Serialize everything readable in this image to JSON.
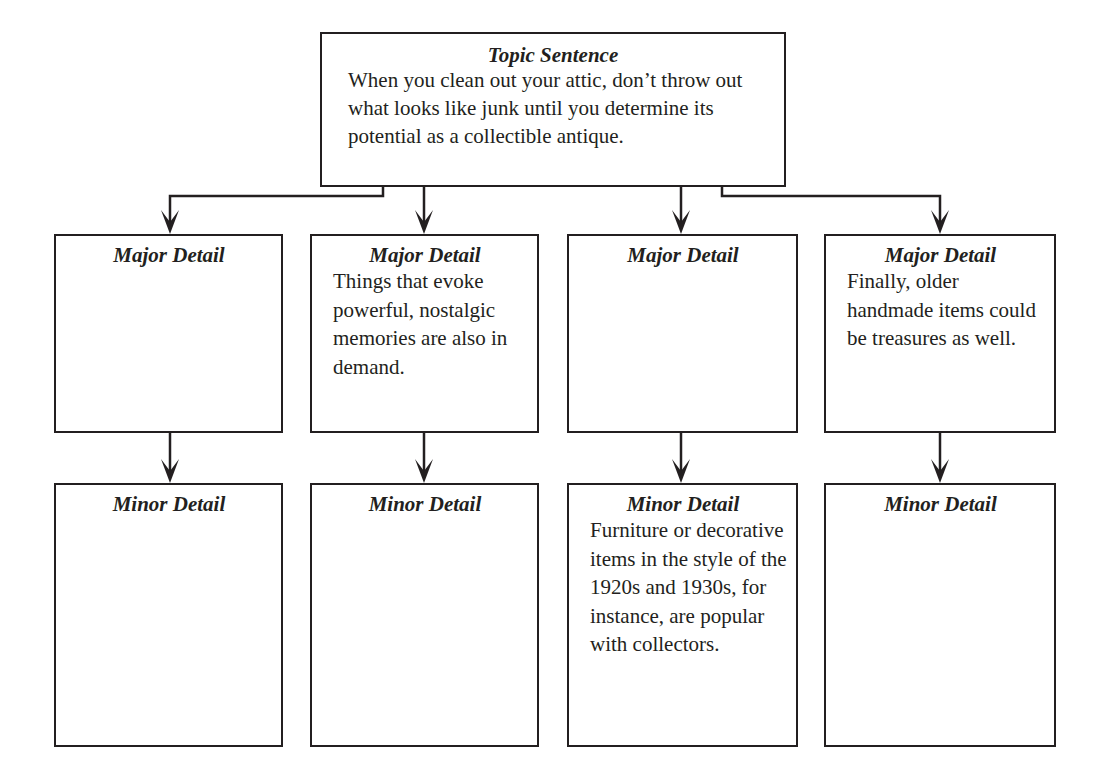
{
  "topic": {
    "title": "Topic Sentence",
    "text": "When you clean out your attic, don’t throw out what looks like junk until you determine its potential as a collectible antique."
  },
  "major_details": [
    {
      "title": "Major Detail",
      "text": ""
    },
    {
      "title": "Major Detail",
      "text": "Things that evoke powerful, nostalgic memories are also in demand."
    },
    {
      "title": "Major Detail",
      "text": ""
    },
    {
      "title": "Major Detail",
      "text": "Finally, older handmade items could be treasures as well."
    }
  ],
  "minor_details": [
    {
      "title": "Minor Detail",
      "text": ""
    },
    {
      "title": "Minor Detail",
      "text": ""
    },
    {
      "title": "Minor Detail",
      "text": "Furniture or decorative items in the style of the 1920s and 1930s, for instance, are popular with collectors."
    },
    {
      "title": "Minor Detail",
      "text": ""
    }
  ],
  "colors": {
    "line": "#231f20",
    "background": "#ffffff"
  }
}
